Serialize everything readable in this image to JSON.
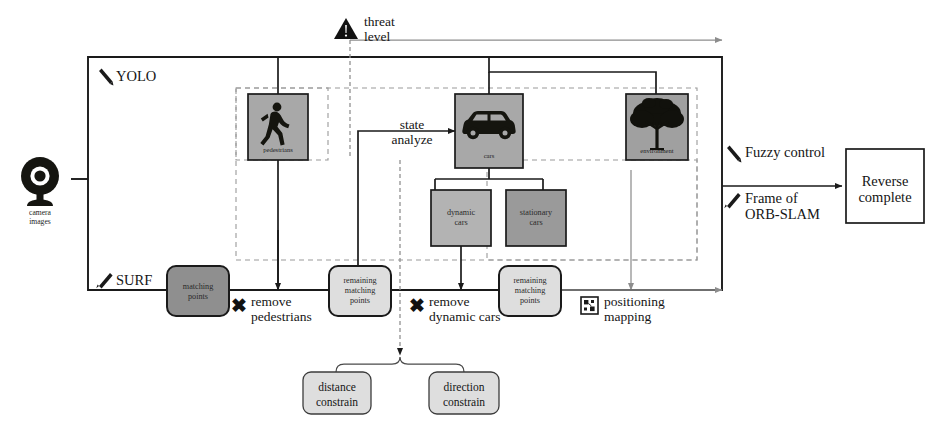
{
  "diagram": {
    "input": {
      "icon": "camera-icon",
      "caption_line1": "camera",
      "caption_line2": "images"
    },
    "module_labels": {
      "yolo": "YOLO",
      "surf": "SURF",
      "yolo_icon": "pen-icon",
      "surf_icon": "pen-icon"
    },
    "detection_nodes": [
      {
        "id": "pedestrians",
        "label": "pedestrians",
        "icon": "pedestrian-icon",
        "fill": "#a8a8a8"
      },
      {
        "id": "cars",
        "label": "cars",
        "icon": "car-icon",
        "fill": "#a8a8a8"
      },
      {
        "id": "environment",
        "label": "environment",
        "icon": "tree-icon",
        "fill": "#a0a0a0"
      }
    ],
    "car_subnodes": [
      {
        "id": "dynamic-cars",
        "line1": "dynamic",
        "line2": "cars",
        "fill": "#b3b3b3"
      },
      {
        "id": "stationary-cars",
        "line1": "stationary",
        "line2": "cars",
        "fill": "#9a9a9a"
      }
    ],
    "feature_nodes": [
      {
        "id": "matching-points",
        "line1": "matching",
        "line2": "points",
        "line3": "",
        "fill": "#8f8f8f"
      },
      {
        "id": "remaining-matching-points-1",
        "line1": "remaining",
        "line2": "matching",
        "line3": "points",
        "fill": "#dedede"
      },
      {
        "id": "remaining-matching-points-2",
        "line1": "remaining",
        "line2": "matching",
        "line3": "points",
        "fill": "#dedede"
      }
    ],
    "constraint_nodes": [
      {
        "id": "distance-constrain",
        "line1": "distance",
        "line2": "constrain",
        "fill": "#dedede"
      },
      {
        "id": "direction-constrain",
        "line1": "direction",
        "line2": "constrain",
        "fill": "#dedede"
      }
    ],
    "edge_labels": {
      "threat_level": "threat\nlevel",
      "threat_icon": "warning-triangle-icon",
      "state_analyze": "state\nanalyze",
      "remove_pedestrians": "remove\npedestrians",
      "remove_dynamic_cars": "remove\ndynamic cars",
      "positioning_mapping": "positioning\nmapping",
      "positioning_icon": "map-grid-icon",
      "fuzzy_control": "Fuzzy control",
      "fuzzy_icon": "pen-icon",
      "frame_of_orb_slam": "Frame of\nORB-SLAM",
      "orb_icon": "pen-icon",
      "cross_mark": "✖"
    },
    "output": {
      "line1": "Reverse",
      "line2": "complete"
    },
    "colors": {
      "stroke": "#1a1a1a",
      "dashed_stroke": "#9a9a9a",
      "gray_line": "#8d8d8d",
      "node_dark": "#8f8f8f",
      "node_mid": "#a8a8a8",
      "node_light": "#dedede",
      "background": "#ffffff"
    }
  }
}
